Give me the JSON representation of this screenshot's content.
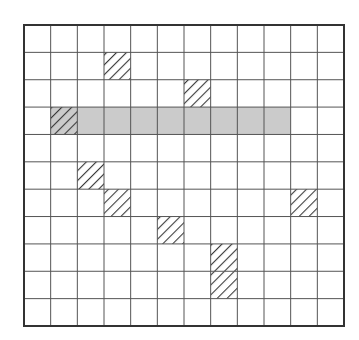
{
  "diagram": {
    "type": "grid",
    "rows": 11,
    "cols": 12,
    "colors": {
      "background": "#ffffff",
      "grid_line": "#555555",
      "border": "#333333",
      "highlight_fill": "#cbcbcb",
      "hatch_line": "#3a3a3a"
    },
    "highlighted_band": {
      "row": 3,
      "col_start": 1,
      "col_end": 9
    },
    "hatched_cells": [
      {
        "row": 1,
        "col": 3
      },
      {
        "row": 2,
        "col": 6
      },
      {
        "row": 3,
        "col": 1
      },
      {
        "row": 5,
        "col": 2
      },
      {
        "row": 6,
        "col": 3
      },
      {
        "row": 6,
        "col": 10
      },
      {
        "row": 7,
        "col": 5
      },
      {
        "row": 8,
        "col": 7
      },
      {
        "row": 9,
        "col": 7
      }
    ]
  }
}
